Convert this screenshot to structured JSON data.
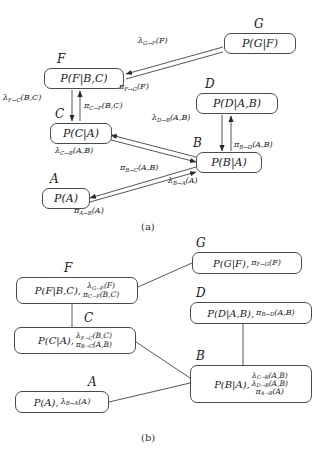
{
  "figure": {
    "caption_a": "(a)",
    "caption_b": "(b)"
  },
  "diagram_a": {
    "nodes": [
      {
        "id": "G",
        "letter": "G",
        "content": "P(G|F)",
        "x": 224,
        "y": 33,
        "w": 72,
        "h": 21
      },
      {
        "id": "F",
        "letter": "F",
        "content": "P(F|B,C)",
        "x": 44,
        "y": 68,
        "w": 80,
        "h": 21
      },
      {
        "id": "D",
        "letter": "D",
        "content": "P(D|A,B)",
        "x": 196,
        "y": 93,
        "w": 82,
        "h": 21
      },
      {
        "id": "C",
        "letter": "C",
        "content": "P(C|A)",
        "x": 50,
        "y": 123,
        "w": 62,
        "h": 21
      },
      {
        "id": "B",
        "letter": "B",
        "content": "P(B|A)",
        "x": 196,
        "y": 152,
        "w": 66,
        "h": 21
      },
      {
        "id": "A",
        "letter": "A",
        "content": "P(A)",
        "x": 42,
        "y": 188,
        "w": 48,
        "h": 21
      }
    ],
    "messages": [
      {
        "id": "lambda-G-to-F",
        "base": "λ",
        "sub": "G→F",
        "arg": "(F)",
        "x": 138,
        "y": 36
      },
      {
        "id": "pi-F-to-G",
        "base": "π",
        "sub": "F→G",
        "arg": "(F)",
        "x": 119,
        "y": 82
      },
      {
        "id": "lambda-F-to-C",
        "base": "λ",
        "sub": "F→C",
        "arg": "(B,C)",
        "x": 3,
        "y": 93
      },
      {
        "id": "pi-C-to-F",
        "base": "π",
        "sub": "C→F",
        "arg": "(B,C)",
        "x": 81,
        "y": 102
      },
      {
        "id": "lambda-D-to-B",
        "base": "λ",
        "sub": "D→B",
        "arg": "(A,B)",
        "x": 152,
        "y": 113
      },
      {
        "id": "pi-B-to-D",
        "base": "π",
        "sub": "B→D",
        "arg": "(A,B)",
        "x": 226,
        "y": 140
      },
      {
        "id": "lambda-C-to-B",
        "base": "λ",
        "sub": "C→B",
        "arg": "(A,B)",
        "x": 55,
        "y": 142
      },
      {
        "id": "pi-B-to-C",
        "base": "π",
        "sub": "B→C",
        "arg": "(A,B)",
        "x": 120,
        "y": 163
      },
      {
        "id": "lambda-B-to-A",
        "base": "λ",
        "sub": "B→A",
        "arg": "(A)",
        "x": 168,
        "y": 176
      },
      {
        "id": "pi-A-to-B",
        "base": "π",
        "sub": "A→B",
        "arg": "(A)",
        "x": 74,
        "y": 205
      }
    ]
  },
  "diagram_b": {
    "nodes": [
      {
        "id": "G",
        "letter": "G",
        "x": 192,
        "y": 252,
        "w": 110,
        "h": 22,
        "main": "P(G|F),",
        "lines": [
          {
            "base": "π",
            "sub": "F→G",
            "arg": "(F)"
          }
        ]
      },
      {
        "id": "F",
        "letter": "F",
        "x": 16,
        "y": 277,
        "w": 122,
        "h": 27,
        "main": "P(F|B,C),",
        "lines": [
          {
            "base": "λ",
            "sub": "G→F",
            "arg": "(F)"
          },
          {
            "base": "π",
            "sub": "C→F",
            "arg": "(B,C)"
          }
        ]
      },
      {
        "id": "D",
        "letter": "D",
        "x": 190,
        "y": 302,
        "w": 122,
        "h": 22,
        "main": "P(D|A,B),",
        "lines": [
          {
            "base": "π",
            "sub": "B→D",
            "arg": "(A,B)"
          }
        ]
      },
      {
        "id": "C",
        "letter": "C",
        "x": 14,
        "y": 327,
        "w": 122,
        "h": 27,
        "main": "P(C|A),",
        "lines": [
          {
            "base": "λ",
            "sub": "F→C",
            "arg": "(B,C)"
          },
          {
            "base": "π",
            "sub": "B→C",
            "arg": "(A,B)"
          }
        ]
      },
      {
        "id": "B",
        "letter": "B",
        "x": 190,
        "y": 365,
        "w": 122,
        "h": 38,
        "main": "P(B|A),",
        "lines": [
          {
            "base": "λ",
            "sub": "C→B",
            "arg": "(A,B)"
          },
          {
            "base": "λ",
            "sub": "D→B",
            "arg": "(A,B)"
          },
          {
            "base": "π",
            "sub": "A→B",
            "arg": "(A)"
          }
        ]
      },
      {
        "id": "A",
        "letter": "A",
        "x": 15,
        "y": 391,
        "w": 94,
        "h": 22,
        "main": "P(A),",
        "lines": [
          {
            "base": "λ",
            "sub": "B→A",
            "arg": "(A)"
          }
        ]
      }
    ]
  },
  "colors": {
    "ink": "#1a1a1a",
    "stroke": "#4a4a4a",
    "background": "#ffffff"
  }
}
